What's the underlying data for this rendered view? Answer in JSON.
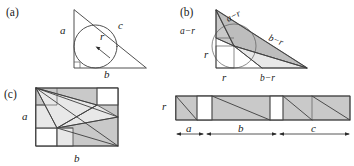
{
  "figure": {
    "panels": [
      {
        "id": "a",
        "label": "(a)",
        "caption": "right triangle with inscribed circle",
        "labels": {
          "leg_a": "a",
          "leg_b": "b",
          "hypotenuse_c": "c",
          "radius_r": "r"
        }
      },
      {
        "id": "b",
        "label": "(b)",
        "caption": "triangle partitioned by incircle tangent lengths",
        "labels": {
          "left_upper": "a−r",
          "top_diagonal": "a−r",
          "right_diagonal": "b−r",
          "left_lower": "r",
          "bottom_left": "r",
          "bottom_right": "b−r"
        }
      },
      {
        "id": "c",
        "label": "(c)",
        "caption": "rectangle dissection a by b",
        "labels": {
          "side_a": "a",
          "side_b": "b"
        }
      },
      {
        "id": "strip",
        "label": "",
        "caption": "unrolled strip of height r and length a + b + c",
        "labels": {
          "height_r": "r",
          "segment_a": "a",
          "segment_b": "b",
          "segment_c": "c"
        }
      }
    ]
  },
  "colors": {
    "shade": "#c9c9c9",
    "shade_alt": "#bdbdbd",
    "light": "#e8e8e8",
    "stroke": "#4a4a4a",
    "background": "#ffffff",
    "text": "#1a1a1a"
  }
}
